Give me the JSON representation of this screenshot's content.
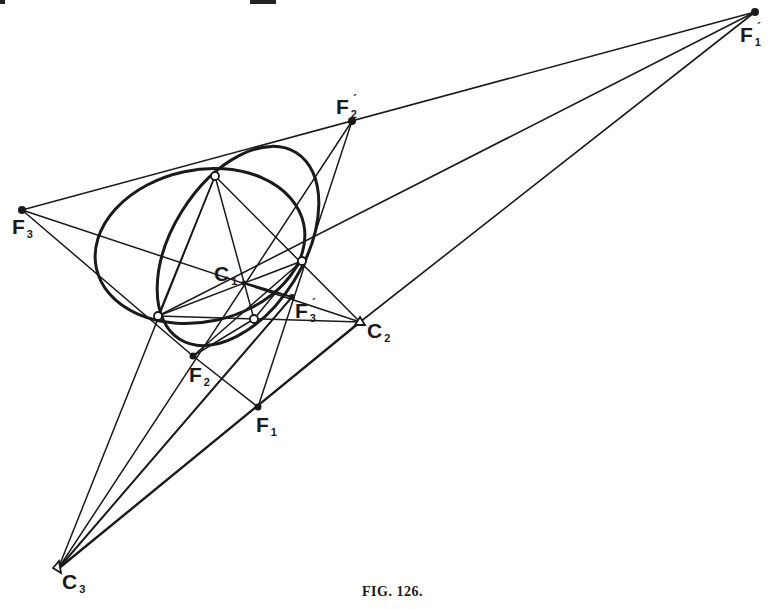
{
  "figure": {
    "caption": "Fig. 126.",
    "caption_prefix": "FIG.",
    "caption_number": "126.",
    "colors": {
      "ink": "#1a1a1a",
      "paper": "#ffffff"
    }
  },
  "labels": {
    "F1_prime": {
      "base": "F",
      "sub": "1",
      "sup": "´"
    },
    "F2_prime": {
      "base": "F",
      "sub": "2",
      "sup": "´"
    },
    "F3": {
      "base": "F",
      "sub": "3"
    },
    "C1": {
      "base": "C",
      "sub": "1"
    },
    "F3_prime": {
      "base": "F",
      "sub": "3",
      "sup": "´"
    },
    "C2": {
      "base": "C",
      "sub": "2"
    },
    "F2": {
      "base": "F",
      "sub": "2"
    },
    "F1": {
      "base": "F",
      "sub": "1"
    },
    "C3": {
      "base": "C",
      "sub": "3"
    }
  },
  "points": {
    "F1_prime": [
      755,
      12
    ],
    "F2_prime": [
      352,
      121
    ],
    "F3": [
      22,
      210
    ],
    "P_top": [
      215,
      176
    ],
    "P_right": [
      302,
      261
    ],
    "P_left": [
      158,
      316
    ],
    "P_bottom": [
      254,
      319
    ],
    "C1": [
      244,
      283
    ],
    "F3_prime": [
      292,
      297
    ],
    "C2": [
      360,
      322
    ],
    "F2": [
      193,
      356
    ],
    "F1": [
      258,
      407
    ],
    "C3": [
      58,
      569
    ]
  }
}
